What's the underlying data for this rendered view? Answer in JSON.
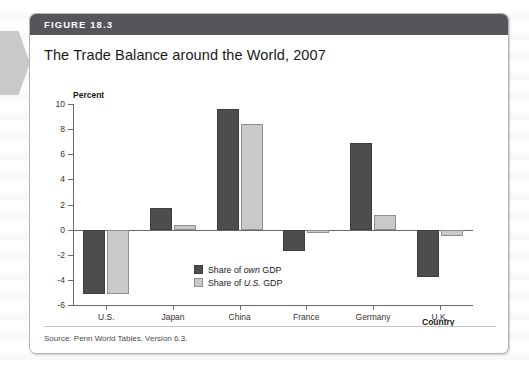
{
  "figure": {
    "header_label": "FIGURE 18.3",
    "title": "The Trade Balance around the World, 2007",
    "source": "Source: Penn World Tables, Version 6.3."
  },
  "colors": {
    "header_bar": "#54565a",
    "series_own": "#4d4d4d",
    "series_us": "#c9c9c9",
    "axis": "#6b6b6b"
  },
  "legend": {
    "items": [
      {
        "prefix": "Share of ",
        "emphasis": "own",
        "suffix": " GDP"
      },
      {
        "prefix": "Share of ",
        "emphasis": "U.S.",
        "suffix": " GDP"
      }
    ]
  },
  "chart_data": {
    "type": "bar",
    "title": "The Trade Balance around the World, 2007",
    "xlabel": "Country",
    "ylabel": "Percent",
    "ylim": [
      -6,
      10
    ],
    "yticks": [
      10,
      8,
      6,
      4,
      2,
      0,
      -2,
      -4,
      -6
    ],
    "ytick_labels": [
      "10",
      "8",
      "6",
      "4",
      "2",
      "0",
      "-2",
      "-4",
      "-6"
    ],
    "grid": false,
    "legend_position": "inside-center-lower",
    "categories": [
      "U.S.",
      "Japan",
      "China",
      "France",
      "Germany",
      "U.K."
    ],
    "series": [
      {
        "name": "Share of own GDP",
        "color": "#4d4d4d",
        "values": [
          -5.1,
          1.7,
          9.6,
          -1.7,
          6.9,
          -3.8
        ]
      },
      {
        "name": "Share of U.S. GDP",
        "color": "#c9c9c9",
        "values": [
          -5.1,
          0.4,
          8.4,
          -0.3,
          1.2,
          -0.5
        ]
      }
    ]
  }
}
